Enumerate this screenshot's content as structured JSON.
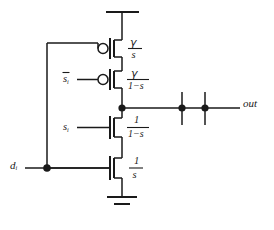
{
  "figure": {
    "type": "circuit-schematic",
    "background_color": "#ffffff",
    "line_color": "#1a1a1a"
  },
  "labels": {
    "input_data": "d",
    "input_data_sub": "i",
    "select": "s",
    "select_sub": "i",
    "select_bar": "s",
    "select_bar_sub": "i",
    "output": "out"
  },
  "transistors": [
    {
      "id": "pmos-top",
      "kind": "pmos",
      "has_bubble": true,
      "gate_source": "d",
      "size_numerator": "γ",
      "size_denominator": "s"
    },
    {
      "id": "pmos-bottom",
      "kind": "pmos",
      "has_bubble": true,
      "gate_source": "s-bar",
      "size_numerator": "γ",
      "size_denominator": "1−s"
    },
    {
      "id": "nmos-top",
      "kind": "nmos",
      "has_bubble": false,
      "gate_source": "s",
      "size_numerator": "1",
      "size_denominator": "1−s"
    },
    {
      "id": "nmos-bottom",
      "kind": "nmos",
      "has_bubble": false,
      "gate_source": "d",
      "size_numerator": "1",
      "size_denominator": "s"
    }
  ],
  "nodes": [
    {
      "id": "supply-rail",
      "kind": "rail",
      "label": ""
    },
    {
      "id": "ground",
      "kind": "ground",
      "label": ""
    },
    {
      "id": "output-junction",
      "kind": "junction-dot"
    },
    {
      "id": "data-junction",
      "kind": "junction-dot"
    },
    {
      "id": "cross-junction-1",
      "kind": "junction-dot"
    },
    {
      "id": "cross-junction-2",
      "kind": "junction-dot"
    }
  ],
  "fractions": {
    "gamma_over_s": {
      "num": "γ",
      "den": "s"
    },
    "gamma_over_one_minus_s": {
      "num": "γ",
      "den": "1−s"
    },
    "one_over_one_minus_s": {
      "num": "1",
      "den": "1−s"
    },
    "one_over_s": {
      "num": "1",
      "den": "s"
    }
  }
}
